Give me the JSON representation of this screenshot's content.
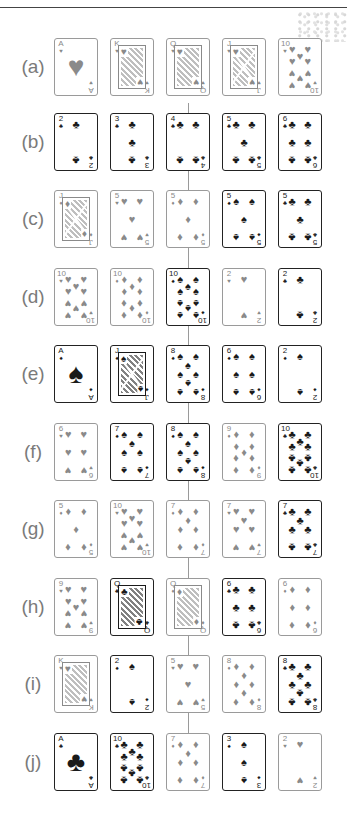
{
  "figure": {
    "rows": [
      {
        "label": "(a)",
        "cards": [
          {
            "rank": "A",
            "suit": "hearts",
            "symbol": "♥",
            "color": "red"
          },
          {
            "rank": "K",
            "suit": "hearts",
            "symbol": "♥",
            "color": "red"
          },
          {
            "rank": "Q",
            "suit": "hearts",
            "symbol": "♥",
            "color": "red"
          },
          {
            "rank": "J",
            "suit": "hearts",
            "symbol": "♥",
            "color": "red"
          },
          {
            "rank": "10",
            "suit": "hearts",
            "symbol": "♥",
            "color": "red"
          }
        ]
      },
      {
        "label": "(b)",
        "cards": [
          {
            "rank": "2",
            "suit": "clubs",
            "symbol": "♣",
            "color": "black"
          },
          {
            "rank": "3",
            "suit": "clubs",
            "symbol": "♣",
            "color": "black"
          },
          {
            "rank": "4",
            "suit": "clubs",
            "symbol": "♣",
            "color": "black"
          },
          {
            "rank": "5",
            "suit": "clubs",
            "symbol": "♣",
            "color": "black"
          },
          {
            "rank": "6",
            "suit": "clubs",
            "symbol": "♣",
            "color": "black"
          }
        ]
      },
      {
        "label": "(c)",
        "cards": [
          {
            "rank": "J",
            "suit": "diamonds",
            "symbol": "♦",
            "color": "red"
          },
          {
            "rank": "5",
            "suit": "hearts",
            "symbol": "♥",
            "color": "red"
          },
          {
            "rank": "5",
            "suit": "diamonds",
            "symbol": "♦",
            "color": "red"
          },
          {
            "rank": "5",
            "suit": "spades",
            "symbol": "♠",
            "color": "black"
          },
          {
            "rank": "5",
            "suit": "clubs",
            "symbol": "♣",
            "color": "black"
          }
        ]
      },
      {
        "label": "(d)",
        "cards": [
          {
            "rank": "10",
            "suit": "hearts",
            "symbol": "♥",
            "color": "red"
          },
          {
            "rank": "10",
            "suit": "diamonds",
            "symbol": "♦",
            "color": "red"
          },
          {
            "rank": "10",
            "suit": "spades",
            "symbol": "♠",
            "color": "black"
          },
          {
            "rank": "2",
            "suit": "hearts",
            "symbol": "♥",
            "color": "red"
          },
          {
            "rank": "2",
            "suit": "clubs",
            "symbol": "♣",
            "color": "black"
          }
        ]
      },
      {
        "label": "(e)",
        "cards": [
          {
            "rank": "A",
            "suit": "spades",
            "symbol": "♠",
            "color": "black"
          },
          {
            "rank": "J",
            "suit": "spades",
            "symbol": "♠",
            "color": "black"
          },
          {
            "rank": "8",
            "suit": "spades",
            "symbol": "♠",
            "color": "black"
          },
          {
            "rank": "6",
            "suit": "spades",
            "symbol": "♠",
            "color": "black"
          },
          {
            "rank": "2",
            "suit": "spades",
            "symbol": "♠",
            "color": "black"
          }
        ]
      },
      {
        "label": "(f)",
        "cards": [
          {
            "rank": "6",
            "suit": "hearts",
            "symbol": "♥",
            "color": "red"
          },
          {
            "rank": "7",
            "suit": "spades",
            "symbol": "♠",
            "color": "black"
          },
          {
            "rank": "8",
            "suit": "spades",
            "symbol": "♠",
            "color": "black"
          },
          {
            "rank": "9",
            "suit": "diamonds",
            "symbol": "♦",
            "color": "red"
          },
          {
            "rank": "10",
            "suit": "clubs",
            "symbol": "♣",
            "color": "black"
          }
        ]
      },
      {
        "label": "(g)",
        "cards": [
          {
            "rank": "5",
            "suit": "diamonds",
            "symbol": "♦",
            "color": "red"
          },
          {
            "rank": "10",
            "suit": "hearts",
            "symbol": "♥",
            "color": "red"
          },
          {
            "rank": "7",
            "suit": "diamonds",
            "symbol": "♦",
            "color": "red"
          },
          {
            "rank": "7",
            "suit": "hearts",
            "symbol": "♥",
            "color": "red"
          },
          {
            "rank": "7",
            "suit": "clubs",
            "symbol": "♣",
            "color": "black"
          }
        ]
      },
      {
        "label": "(h)",
        "cards": [
          {
            "rank": "9",
            "suit": "hearts",
            "symbol": "♥",
            "color": "red"
          },
          {
            "rank": "Q",
            "suit": "clubs",
            "symbol": "♣",
            "color": "black"
          },
          {
            "rank": "Q",
            "suit": "diamonds",
            "symbol": "♦",
            "color": "red"
          },
          {
            "rank": "6",
            "suit": "clubs",
            "symbol": "♣",
            "color": "black"
          },
          {
            "rank": "6",
            "suit": "diamonds",
            "symbol": "♦",
            "color": "red"
          }
        ]
      },
      {
        "label": "(i)",
        "cards": [
          {
            "rank": "K",
            "suit": "hearts",
            "symbol": "♥",
            "color": "red"
          },
          {
            "rank": "2",
            "suit": "spades",
            "symbol": "♠",
            "color": "black"
          },
          {
            "rank": "5",
            "suit": "hearts",
            "symbol": "♥",
            "color": "red"
          },
          {
            "rank": "8",
            "suit": "diamonds",
            "symbol": "♦",
            "color": "red"
          },
          {
            "rank": "8",
            "suit": "clubs",
            "symbol": "♣",
            "color": "black"
          }
        ]
      },
      {
        "label": "(j)",
        "cards": [
          {
            "rank": "A",
            "suit": "clubs",
            "symbol": "♣",
            "color": "black"
          },
          {
            "rank": "10",
            "suit": "clubs",
            "symbol": "♣",
            "color": "black"
          },
          {
            "rank": "7",
            "suit": "diamonds",
            "symbol": "♦",
            "color": "red"
          },
          {
            "rank": "3",
            "suit": "spades",
            "symbol": "♠",
            "color": "black"
          },
          {
            "rank": "2",
            "suit": "hearts",
            "symbol": "♥",
            "color": "red"
          }
        ]
      }
    ]
  },
  "colors": {
    "red_suit_print": "#8a8a8a",
    "black_suit_print": "#1a1a1a",
    "label_text": "#7a7a7a",
    "connector_line": "#9a9a9a"
  }
}
